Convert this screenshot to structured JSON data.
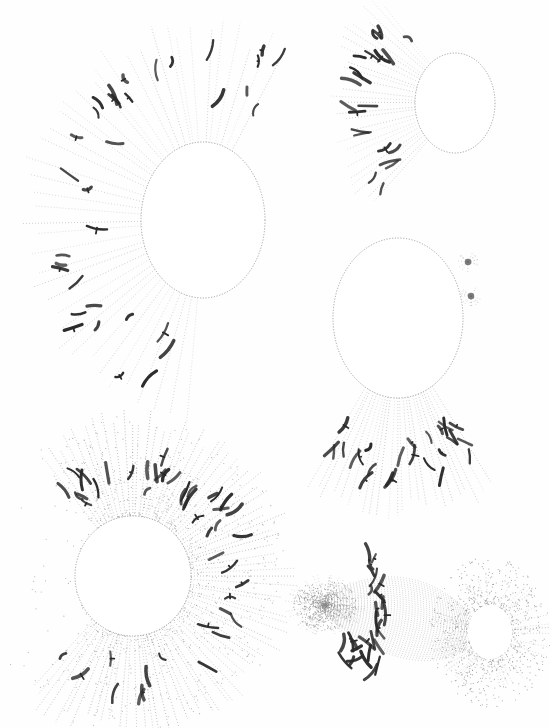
{
  "plate": {
    "description": "Scientific plate of five stippled drawings of cells in division: nuclei with radiating spindle fibers and dark chromosomes",
    "background": "#fefefe",
    "ink": "#2a2a2a",
    "stipple": "#8a8a8a"
  },
  "figures": [
    {
      "id": "fig-top-left",
      "nucleus": {
        "cx": 203,
        "cy": 220,
        "rx": 62,
        "ry": 78
      },
      "rays": {
        "from_deg": 95,
        "to_deg": 300,
        "count": 42,
        "inner": 70,
        "outer": 190,
        "density": 0.35
      },
      "chromosome_band": {
        "r": 140,
        "count": 34
      },
      "halo": false
    },
    {
      "id": "fig-top-right",
      "nucleus": {
        "cx": 455,
        "cy": 103,
        "rx": 40,
        "ry": 50
      },
      "rays": {
        "from_deg": 130,
        "to_deg": 235,
        "count": 26,
        "inner": 42,
        "outer": 135,
        "density": 0.35
      },
      "chromosome_band": {
        "r": 95,
        "count": 22
      },
      "halo": false
    },
    {
      "id": "fig-middle-right",
      "nucleus": {
        "cx": 398,
        "cy": 318,
        "rx": 65,
        "ry": 80
      },
      "rays": {
        "from_deg": 58,
        "to_deg": 122,
        "count": 24,
        "inner": 80,
        "outer": 190,
        "density": 0.4
      },
      "chromosome_band": {
        "r": 130,
        "count": 26
      },
      "centrosomes": [
        {
          "x": 468,
          "y": 262
        },
        {
          "x": 471,
          "y": 296
        }
      ],
      "halo": false
    },
    {
      "id": "fig-bottom-left",
      "nucleus": {
        "cx": 133,
        "cy": 576,
        "rx": 58,
        "ry": 60
      },
      "rays": {
        "from_deg": 0,
        "to_deg": 360,
        "count": 110,
        "inner": 55,
        "outer": 160,
        "density": 0.6,
        "gap_from": 135,
        "gap_to": 230
      },
      "chromosome_band": {
        "r": 105,
        "count": 48
      },
      "halo": true
    },
    {
      "id": "fig-bottom-right",
      "spindle": {
        "left_pole": {
          "x": 325,
          "y": 605
        },
        "right_pole": {
          "x": 487,
          "y": 630
        }
      },
      "nucleus": {
        "cx": 490,
        "cy": 632,
        "rx": 22,
        "ry": 27
      },
      "chromosome_band": {
        "x": 380,
        "count": 20
      },
      "halo": true
    }
  ]
}
